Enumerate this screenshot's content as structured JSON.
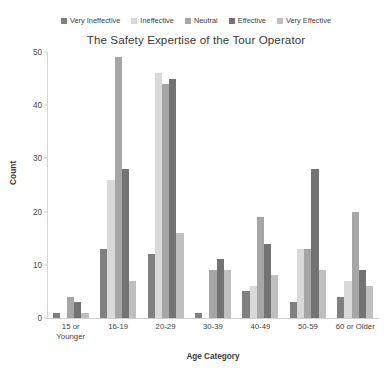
{
  "chart_data": {
    "type": "bar",
    "title": "The Safety Expertise of the Tour Operator",
    "xlabel": "Age Category",
    "ylabel": "Count",
    "ylim": [
      0,
      50
    ],
    "yticks": [
      0,
      10,
      20,
      30,
      40,
      50
    ],
    "grid": false,
    "legend_position": "top",
    "categories": [
      "15 or Younger",
      "16-19",
      "20-29",
      "30-39",
      "40-49",
      "50-59",
      "60 or Older"
    ],
    "category_lines": [
      [
        "15 or",
        "Younger"
      ],
      [
        "16-19"
      ],
      [
        "20-29"
      ],
      [
        "30-39"
      ],
      [
        "40-49"
      ],
      [
        "50-59"
      ],
      [
        "60 or Older"
      ]
    ],
    "series": [
      {
        "name": "Very Ineffective",
        "color": "#808080",
        "values": [
          1,
          13,
          12,
          1,
          5,
          3,
          4
        ]
      },
      {
        "name": "Ineffective",
        "color": "#d9d9d9",
        "values": [
          0,
          26,
          46,
          0,
          6,
          13,
          7
        ]
      },
      {
        "name": "Neutral",
        "color": "#a6a6a6",
        "values": [
          4,
          49,
          44,
          9,
          19,
          13,
          20
        ]
      },
      {
        "name": "Effective",
        "color": "#737373",
        "values": [
          3,
          28,
          45,
          11,
          14,
          28,
          9
        ]
      },
      {
        "name": "Very Effective",
        "color": "#bfbfbf",
        "values": [
          1,
          7,
          16,
          9,
          8,
          9,
          6
        ]
      }
    ]
  }
}
